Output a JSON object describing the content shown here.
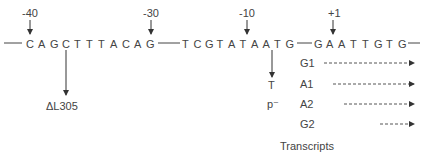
{
  "positions": [
    "-40",
    "-30",
    "-10",
    "+1"
  ],
  "sequence": {
    "segment1": [
      "C",
      "A",
      "G",
      "C",
      "T",
      "T",
      "T",
      "A",
      "C",
      "A",
      "G"
    ],
    "segment2": [
      "T",
      "C",
      "G",
      "T",
      "A",
      "T",
      "A",
      "A",
      "T",
      "G"
    ],
    "segment3": [
      "G",
      "A",
      "A",
      "T",
      "T",
      "G",
      "T",
      "G"
    ]
  },
  "mutations": {
    "deletion": "ΔL305",
    "point_base": "T",
    "point_label": "p⁻"
  },
  "transcripts": {
    "items": [
      {
        "label": "G1"
      },
      {
        "label": "A1"
      },
      {
        "label": "A2"
      },
      {
        "label": "G2"
      }
    ],
    "caption": "Transcripts"
  }
}
